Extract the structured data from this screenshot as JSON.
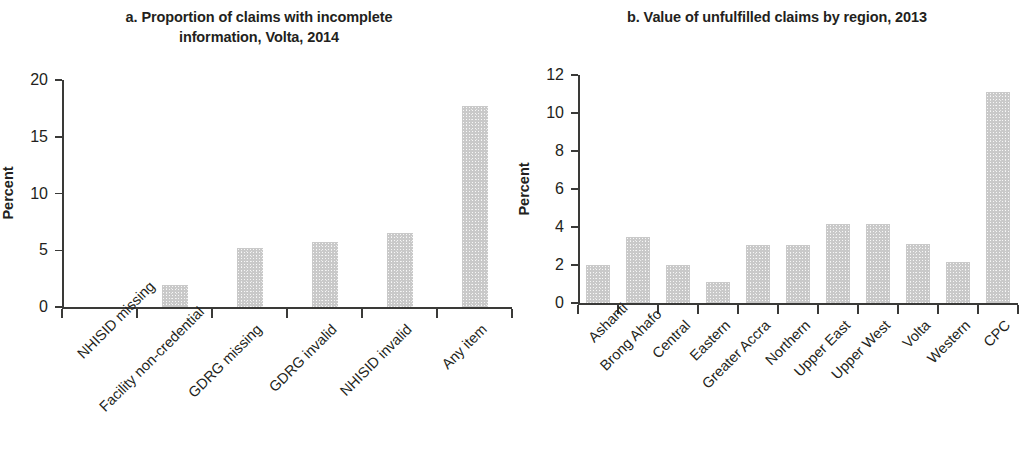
{
  "figure": {
    "background": "#ffffff",
    "bar_color": "#c9c9c9",
    "axis_color": "#3a3a38",
    "text_color": "#231f20"
  },
  "panel_a": {
    "title_line1": "a. Proportion of claims with incomplete",
    "title_line2": "information, Volta, 2014",
    "ylabel": "Percent"
  },
  "panel_b": {
    "title_line1": "b. Value of unfulfilled claims by region, 2013",
    "title_line2": "",
    "ylabel": "Percent"
  },
  "chart_data": [
    {
      "type": "bar",
      "id": "panel-a",
      "title": "a. Proportion of claims with incomplete information, Volta, 2014",
      "xlabel": "",
      "ylabel": "Percent",
      "ylim": [
        0,
        20
      ],
      "yticks": [
        0,
        5,
        10,
        15,
        20
      ],
      "ytick_labels": [
        "0",
        "5",
        "10",
        "15",
        "20"
      ],
      "grid": false,
      "legend": "none",
      "categories": [
        "NHISID missing",
        "Facility non-credential",
        "GDRG missing",
        "GDRG invalid",
        "NHISID invalid",
        "Any item"
      ],
      "values": [
        0,
        1.9,
        5.2,
        5.7,
        6.5,
        17.7
      ]
    },
    {
      "type": "bar",
      "id": "panel-b",
      "title": "b. Value of unfulfilled claims by region, 2013",
      "xlabel": "",
      "ylabel": "Percent",
      "ylim": [
        0,
        12
      ],
      "yticks": [
        0,
        2,
        4,
        6,
        8,
        10,
        12
      ],
      "ytick_labels": [
        "0",
        "2",
        "4",
        "6",
        "8",
        "10",
        "12"
      ],
      "grid": false,
      "legend": "none",
      "categories": [
        "Ashanti",
        "Brong Ahafo",
        "Central",
        "Eastern",
        "Greater Accra",
        "Northern",
        "Upper East",
        "Upper West",
        "Volta",
        "Western",
        "CPC"
      ],
      "values": [
        2.0,
        3.5,
        2.0,
        1.1,
        3.05,
        3.05,
        4.15,
        4.15,
        3.1,
        2.15,
        11.1
      ]
    }
  ]
}
